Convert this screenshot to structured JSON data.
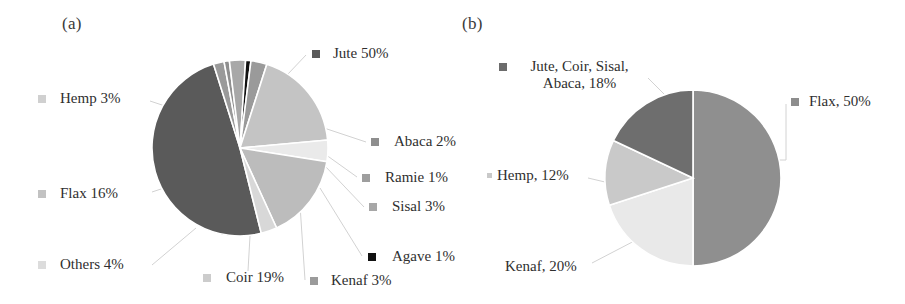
{
  "figure": {
    "panel_a_letter": "(a)",
    "panel_b_letter": "(b)"
  },
  "colors": {
    "dark_gray": "#5a5a5a",
    "mid_gray": "#8a8a8a",
    "light_gray": "#bdbdbd",
    "lighter_gray": "#d3d3d3",
    "very_light_gray": "#e4e4e4",
    "pale_gray": "#efefef",
    "black": "#111111",
    "leader_line": "#cfcfcf",
    "text": "#2f2f2f",
    "background": "#ffffff"
  },
  "chart_data": [
    {
      "type": "pie",
      "title": "(a)",
      "labels": [
        "Jute 50%",
        "Abaca 2%",
        "Ramie 1%",
        "Sisal 3%",
        "Agave 1%",
        "Kenaf 3%",
        "Coir 19%",
        "Others 4%",
        "Flax 16%",
        "Hemp 3%"
      ],
      "categories": [
        "Jute",
        "Abaca",
        "Ramie",
        "Sisal",
        "Agave",
        "Kenaf",
        "Coir",
        "Others",
        "Flax",
        "Hemp"
      ],
      "values": [
        50,
        2,
        1,
        3,
        1,
        3,
        19,
        4,
        16,
        3
      ],
      "units": "%",
      "slice_colors": [
        "#5a5a5a",
        "#9a9a9a",
        "#8f8f8f",
        "#a8a8a8",
        "#111111",
        "#9a9a9a",
        "#c4c4c4",
        "#eaeaea",
        "#bcbcbc",
        "#d8d8d8"
      ],
      "legend_position": "around-pie-with-leader-lines",
      "grid": false
    },
    {
      "type": "pie",
      "title": "(b)",
      "labels": [
        "Flax, 50%",
        "Kenaf, 20%",
        "Hemp, 12%",
        "Jute, Coir, Sisal, Abaca, 18%"
      ],
      "categories": [
        "Flax",
        "Kenaf",
        "Hemp",
        "Jute, Coir, Sisal, Abaca"
      ],
      "values": [
        50,
        20,
        12,
        18
      ],
      "units": "%",
      "slice_colors": [
        "#8f8f8f",
        "#e9e9e9",
        "#c9c9c9",
        "#6e6e6e"
      ],
      "legend_position": "around-pie-with-leader-lines",
      "grid": false
    }
  ],
  "chart_a": {
    "labels": {
      "jute": "Jute 50%",
      "hemp": "Hemp 3%",
      "flax": "Flax 16%",
      "others": "Others 4%",
      "abaca": "Abaca 2%",
      "ramie": "Ramie 1%",
      "sisal": "Sisal 3%",
      "agave": "Agave 1%",
      "coir": "Coir 19%",
      "kenaf": "Kenaf 3%"
    }
  },
  "chart_b": {
    "labels": {
      "bundle": "Jute, Coir, Sisal, Abaca, 18%",
      "flax": "Flax, 50%",
      "hemp": "Hemp, 12%",
      "kenaf": "Kenaf, 20%"
    }
  }
}
